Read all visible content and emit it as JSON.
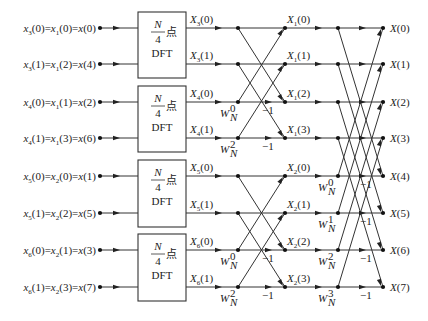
{
  "diagram": {
    "type": "radix-2 DIT FFT signal flow graph (N=8, 3 stages)",
    "inputs": [
      {
        "a": "x",
        "as": "3",
        "ai": "0",
        "b": "x",
        "bs": "1",
        "bi": "0",
        "c": "x(0)"
      },
      {
        "a": "x",
        "as": "3",
        "ai": "1",
        "b": "x",
        "bs": "1",
        "bi": "2",
        "c": "x(4)"
      },
      {
        "a": "x",
        "as": "4",
        "ai": "0",
        "b": "x",
        "bs": "1",
        "bi": "1",
        "c": "x(2)"
      },
      {
        "a": "x",
        "as": "4",
        "ai": "1",
        "b": "x",
        "bs": "1",
        "bi": "3",
        "c": "x(6)"
      },
      {
        "a": "x",
        "as": "5",
        "ai": "0",
        "b": "x",
        "bs": "2",
        "bi": "0",
        "c": "x(1)"
      },
      {
        "a": "x",
        "as": "5",
        "ai": "1",
        "b": "x",
        "bs": "2",
        "bi": "2",
        "c": "x(5)"
      },
      {
        "a": "x",
        "as": "6",
        "ai": "0",
        "b": "x",
        "bs": "2",
        "bi": "1",
        "c": "x(3)"
      },
      {
        "a": "x",
        "as": "6",
        "ai": "1",
        "b": "x",
        "bs": "2",
        "bi": "3",
        "c": "x(7)"
      }
    ],
    "input_labels": [
      "x3(0)=x1(0)=x(0)",
      "x3(1)=x1(2)=x(4)",
      "x4(0)=x1(1)=x(2)",
      "x4(1)=x1(3)=x(6)",
      "x5(0)=x2(0)=x(1)",
      "x5(1)=x2(2)=x(5)",
      "x6(0)=x2(1)=x(3)",
      "x6(1)=x2(3)=x(7)"
    ],
    "dft_blocks": [
      {
        "num": "N",
        "den": "4",
        "suffix": "点",
        "label": "DFT"
      },
      {
        "num": "N",
        "den": "4",
        "suffix": "点",
        "label": "DFT"
      },
      {
        "num": "N",
        "den": "4",
        "suffix": "点",
        "label": "DFT"
      },
      {
        "num": "N",
        "den": "4",
        "suffix": "点",
        "label": "DFT"
      }
    ],
    "stage1_outputs": [
      "X3(0)",
      "X3(1)",
      "X4(0)",
      "X4(1)",
      "X5(0)",
      "X5(1)",
      "X6(0)",
      "X6(1)"
    ],
    "stage1_outputs_parts": [
      {
        "s": "3",
        "i": "0"
      },
      {
        "s": "3",
        "i": "1"
      },
      {
        "s": "4",
        "i": "0"
      },
      {
        "s": "4",
        "i": "1"
      },
      {
        "s": "5",
        "i": "0"
      },
      {
        "s": "5",
        "i": "1"
      },
      {
        "s": "6",
        "i": "0"
      },
      {
        "s": "6",
        "i": "1"
      }
    ],
    "stage2_twiddles": [
      {
        "row": 2,
        "exp": "0"
      },
      {
        "row": 3,
        "exp": "2"
      },
      {
        "row": 6,
        "exp": "0"
      },
      {
        "row": 7,
        "exp": "2"
      }
    ],
    "stage2_outputs": [
      "X1(0)",
      "X1(1)",
      "X1(2)",
      "X1(3)",
      "X2(0)",
      "X2(1)",
      "X2(2)",
      "X2(3)"
    ],
    "stage2_outputs_parts": [
      {
        "s": "1",
        "i": "0"
      },
      {
        "s": "1",
        "i": "1"
      },
      {
        "s": "1",
        "i": "2"
      },
      {
        "s": "1",
        "i": "3"
      },
      {
        "s": "2",
        "i": "0"
      },
      {
        "s": "2",
        "i": "1"
      },
      {
        "s": "2",
        "i": "2"
      },
      {
        "s": "2",
        "i": "3"
      }
    ],
    "stage3_twiddles": [
      {
        "row": 4,
        "exp": "0"
      },
      {
        "row": 5,
        "exp": "1"
      },
      {
        "row": 6,
        "exp": "2"
      },
      {
        "row": 7,
        "exp": "3"
      }
    ],
    "final_outputs": [
      "X(0)",
      "X(1)",
      "X(2)",
      "X(3)",
      "X(4)",
      "X(5)",
      "X(6)",
      "X(7)"
    ],
    "twiddle_base": "W",
    "twiddle_sub": "N",
    "minus_one": "−1"
  }
}
